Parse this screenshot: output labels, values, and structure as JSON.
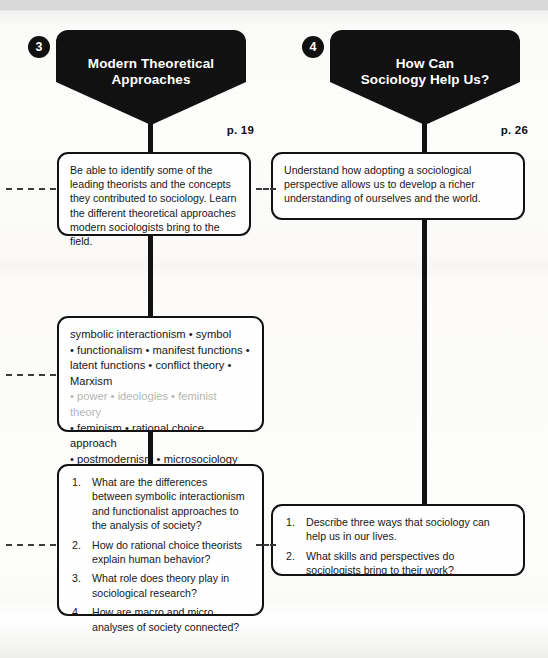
{
  "page": {
    "background": "#fdfdfb",
    "ink": "#121212",
    "accent": "#111111"
  },
  "columns": [
    {
      "number": "3",
      "title": "Modern Theoretical\nApproaches",
      "page_ref": "p. 19",
      "objective": "Be able to identify some of the leading theorists and the concepts they contributed to sociology. Learn the different theoretical approaches modern sociologists bring to the field.",
      "keywords_lines": [
        "symbolic interactionism • symbol",
        "• functionalism • manifest functions •",
        "latent functions • conflict theory • Marxism",
        "• power • ideologies • feminist theory",
        "• feminism • rational choice approach",
        "• postmodernism • microsociology",
        "• macrosociology"
      ],
      "keywords_faded_index": 3,
      "questions": [
        "What are the differences between symbolic interactionism and functionalist approaches to the analysis of society?",
        "How do rational choice theorists explain human behavior?",
        "What role does theory play in sociological research?",
        "How are macro and micro analyses of society connected?"
      ]
    },
    {
      "number": "4",
      "title": "How Can\nSociology Help Us?",
      "page_ref": "p. 26",
      "objective": "Understand how adopting a sociological perspective allows us to develop a richer understanding of ourselves and the world.",
      "keywords_lines": [],
      "keywords_faded_index": -1,
      "questions": [
        "Describe three ways that sociology can help us in our lives.",
        "What skills and perspectives do sociologists bring to their work?"
      ]
    }
  ]
}
